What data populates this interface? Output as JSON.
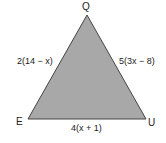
{
  "diagram": {
    "type": "triangle",
    "fill_color": "#a8a8a8",
    "stroke_color": "#444444",
    "vertices": {
      "top": "Q",
      "bottom_left": "E",
      "bottom_right": "U"
    },
    "sides": {
      "QE": "2(14 − x)",
      "QU": "5(3x − 8)",
      "EU": "4(x + 1)"
    }
  }
}
